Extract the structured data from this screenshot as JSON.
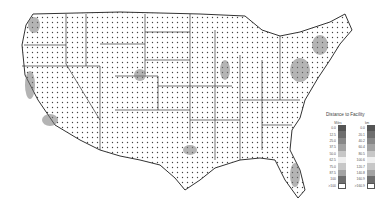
{
  "map": {
    "title": "Distance to Facility",
    "region": "Contiguous United States",
    "background_pattern": "dotted",
    "border_color": "#333333",
    "land_color": "#ffffff"
  },
  "legend": {
    "title": "Distance to Facility",
    "columns": [
      {
        "header": "Miles",
        "values": [
          "0.0",
          "12.5",
          "25.0",
          "37.5",
          "50.0",
          "62.5",
          "75.0",
          "87.5",
          "100",
          ">100"
        ]
      },
      {
        "header": "km",
        "values": [
          "0.0",
          "20.1",
          "40.2",
          "60.4",
          "80.5",
          "100.6",
          "120.7",
          "140.8",
          "160.9",
          ">160.9"
        ]
      }
    ],
    "colors": [
      "#555555",
      "#6e6e6e",
      "#888888",
      "#a3a3a3",
      "#c7c7c7",
      "#f0f0f0",
      "#c7c7c7",
      "#a3a3a3",
      "#6e6e6e",
      "#ffffff"
    ]
  }
}
